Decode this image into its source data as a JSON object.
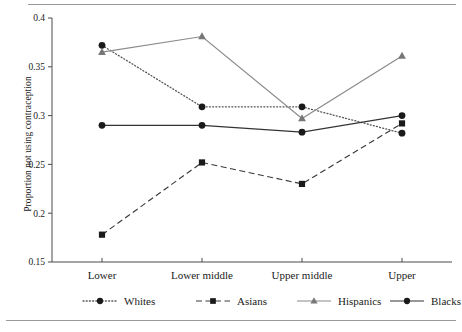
{
  "chart_data": {
    "type": "line",
    "title": "",
    "xlabel": "",
    "ylabel": "Proportion not using contraception",
    "categories": [
      "Lower",
      "Lower middle",
      "Upper middle",
      "Upper"
    ],
    "ylim": [
      0.15,
      0.4
    ],
    "yticks": [
      0.15,
      0.2,
      0.25,
      0.3,
      0.35,
      0.4
    ],
    "ytick_labels": [
      "0.15",
      "0.2",
      "0.25",
      "0.3",
      "0.35",
      "0.4"
    ],
    "grid": false,
    "legend_position": "bottom",
    "series": [
      {
        "name": "Whites",
        "values": [
          0.372,
          0.309,
          0.309,
          0.282
        ],
        "line_style": "dotted",
        "marker": "circle",
        "color": "#1a1a1a",
        "line_color": "#555555"
      },
      {
        "name": "Asians",
        "values": [
          0.178,
          0.252,
          0.23,
          0.292
        ],
        "line_style": "dashed",
        "marker": "square",
        "color": "#1a1a1a",
        "line_color": "#3a3a3a"
      },
      {
        "name": "Hispanics",
        "values": [
          0.365,
          0.381,
          0.297,
          0.361
        ],
        "line_style": "solid",
        "marker": "triangle",
        "color": "#777777",
        "line_color": "#8a8a8a"
      },
      {
        "name": "Blacks",
        "values": [
          0.29,
          0.29,
          0.283,
          0.3
        ],
        "line_style": "solid",
        "marker": "circle",
        "color": "#1a1a1a",
        "line_color": "#333333"
      }
    ]
  }
}
